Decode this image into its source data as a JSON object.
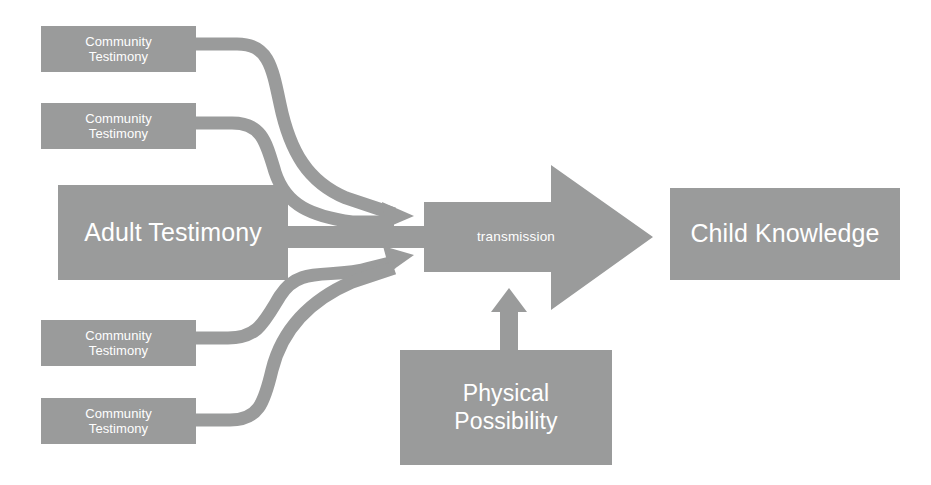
{
  "diagram": {
    "palette": {
      "node_fill": "#9a9b9b",
      "connector_fill": "#9a9b9b",
      "node_text": "#ffffff",
      "background": "#ffffff"
    },
    "nodes": [
      {
        "id": "community-testimony-1",
        "label": "Community\nTestimony",
        "x": 41,
        "y": 26,
        "w": 155,
        "h": 46,
        "size": "small"
      },
      {
        "id": "community-testimony-2",
        "label": "Community\nTestimony",
        "x": 41,
        "y": 103,
        "w": 155,
        "h": 46,
        "size": "small"
      },
      {
        "id": "adult-testimony",
        "label": "Adult Testimony",
        "x": 58,
        "y": 185,
        "w": 230,
        "h": 95,
        "size": "large"
      },
      {
        "id": "community-testimony-3",
        "label": "Community\nTestimony",
        "x": 41,
        "y": 320,
        "w": 155,
        "h": 46,
        "size": "small"
      },
      {
        "id": "community-testimony-4",
        "label": "Community\nTestimony",
        "x": 41,
        "y": 398,
        "w": 155,
        "h": 46,
        "size": "small"
      },
      {
        "id": "physical-possibility",
        "label": "Physical\nPossibility",
        "x": 400,
        "y": 350,
        "w": 212,
        "h": 115,
        "size": "med"
      },
      {
        "id": "child-knowledge",
        "label": "Child Knowledge",
        "x": 670,
        "y": 188,
        "w": 230,
        "h": 92,
        "size": "large"
      }
    ],
    "transmission_arrow": {
      "label": "transmission",
      "label_x": 515,
      "label_y": 237,
      "body_left": 424,
      "body_top": 202,
      "body_bottom": 272,
      "head_left": 551,
      "head_top": 165,
      "head_bottom": 310,
      "tip_x": 653,
      "tip_y": 237
    },
    "connectors": [
      {
        "id": "community-1-to-transmission",
        "from": "community-testimony-1",
        "to": "transmission-arrow",
        "style": "curved-s"
      },
      {
        "id": "community-2-to-transmission",
        "from": "community-testimony-2",
        "to": "transmission-arrow",
        "style": "curved-s"
      },
      {
        "id": "adult-testimony-to-transmission",
        "from": "adult-testimony",
        "to": "transmission-arrow",
        "style": "straight-bar"
      },
      {
        "id": "community-3-to-transmission",
        "from": "community-testimony-3",
        "to": "transmission-arrow",
        "style": "curved-s"
      },
      {
        "id": "community-4-to-transmission",
        "from": "community-testimony-4",
        "to": "transmission-arrow",
        "style": "curved-s"
      },
      {
        "id": "physical-possibility-to-transmission",
        "from": "physical-possibility",
        "to": "transmission-arrow",
        "style": "vertical-arrow"
      }
    ]
  }
}
